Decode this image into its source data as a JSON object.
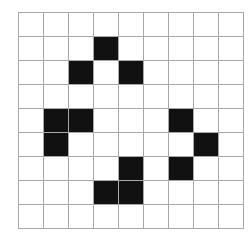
{
  "grid": {
    "rows": 9,
    "cols": 9,
    "filled_color": "#111111",
    "empty_color": "#ffffff",
    "line_color": "#a8a8a8",
    "filled_cells": [
      [
        1,
        3
      ],
      [
        2,
        2
      ],
      [
        2,
        4
      ],
      [
        4,
        1
      ],
      [
        4,
        2
      ],
      [
        4,
        6
      ],
      [
        5,
        1
      ],
      [
        5,
        7
      ],
      [
        6,
        4
      ],
      [
        6,
        6
      ],
      [
        7,
        3
      ],
      [
        7,
        4
      ]
    ]
  }
}
